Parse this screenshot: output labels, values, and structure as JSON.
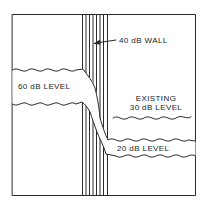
{
  "diagram": {
    "colors": {
      "ink": "#2a2a2a",
      "background": "#ffffff"
    },
    "labels": {
      "wall": "40 dB WALL",
      "source_level": "60 dB LEVEL",
      "existing_line1": "EXISTING",
      "existing_line2": "30 dB LEVEL",
      "transmitted_level": "20 dB LEVEL"
    },
    "elements": [
      {
        "name": "wall",
        "value_db": 40
      },
      {
        "name": "source-room-level",
        "value_db": 60
      },
      {
        "name": "existing-receiving-room-level",
        "value_db": 30
      },
      {
        "name": "transmitted-level",
        "value_db": 20
      }
    ]
  }
}
